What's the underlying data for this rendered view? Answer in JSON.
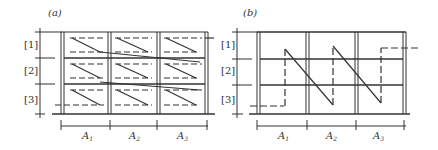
{
  "panels": [
    {
      "id": "a",
      "label": "(a)",
      "row_labels": [
        "[1]",
        "[2]",
        "[3]"
      ],
      "column_labels": [
        {
          "base": "A",
          "sub": "1"
        },
        {
          "base": "A",
          "sub": "2"
        },
        {
          "base": "A",
          "sub": "3"
        }
      ],
      "description": "3x3 grid with dashed/solid zig-zag path within each cell (row-wise traversal)"
    },
    {
      "id": "b",
      "label": "(b)",
      "row_labels": [
        "[1]",
        "[2]",
        "[3]"
      ],
      "column_labels": [
        {
          "base": "A",
          "sub": "1"
        },
        {
          "base": "A",
          "sub": "2"
        },
        {
          "base": "A",
          "sub": "3"
        }
      ],
      "description": "3x3 grid with column-wise zig-zag path: dashed vertical up, solid diagonal down"
    }
  ],
  "colors": {
    "line": "#333333",
    "background": "#ffffff"
  }
}
